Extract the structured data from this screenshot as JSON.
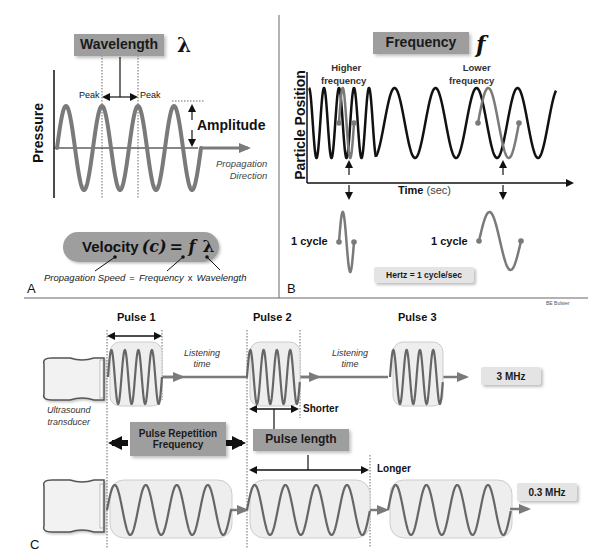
{
  "colors": {
    "wave_gray": "#7a7a7a",
    "wave_black": "#111111",
    "box_gray": "#9e9e9e",
    "light_box": "#e4e4e4",
    "pulse_box_fill": "#eeeeee",
    "divider": "#666666"
  },
  "panel_a": {
    "letter": "A",
    "wavelength_label": "Wavelength",
    "lambda_symbol": "λ",
    "peak_left": "Peak",
    "peak_right": "Peak",
    "amplitude_label": "Amplitude",
    "y_axis_label": "Pressure",
    "propagation_line1": "Propagation",
    "propagation_line2": "Direction",
    "velocity_pill": {
      "word": "Velocity",
      "c": "(c)",
      "eq": "= f",
      "lambda": "λ"
    },
    "equation_text": {
      "speed": "Propagation Speed",
      "equals": "=",
      "frequency": "Frequency",
      "times": "x",
      "wavelength": "Wavelength"
    }
  },
  "panel_b": {
    "letter": "B",
    "frequency_label": "Frequency",
    "f_symbol": "f",
    "higher_line1": "Higher",
    "higher_line2": "frequency",
    "lower_line1": "Lower",
    "lower_line2": "frequency",
    "y_axis_label": "Particle Position",
    "x_axis_label_bold": "Time",
    "x_axis_label_unit": "(sec)",
    "cycle_left": "1 cycle",
    "cycle_right": "1 cycle",
    "hertz_box": "Hertz = 1 cycle/sec"
  },
  "credit": "BE Bulwer",
  "panel_c": {
    "letter": "C",
    "pulse1": "Pulse 1",
    "pulse2": "Pulse 2",
    "pulse3": "Pulse 3",
    "listening1_line1": "Listening",
    "listening1_line2": "time",
    "listening2_line1": "Listening",
    "listening2_line2": "time",
    "transducer_line1": "Ultrasound",
    "transducer_line2": "transducer",
    "freq_top": "3 MHz",
    "freq_bottom": "0.3 MHz",
    "shorter": "Shorter",
    "longer": "Longer",
    "prf_line1": "Pulse Repetition",
    "prf_line2": "Frequency",
    "pulse_length": "Pulse length"
  }
}
